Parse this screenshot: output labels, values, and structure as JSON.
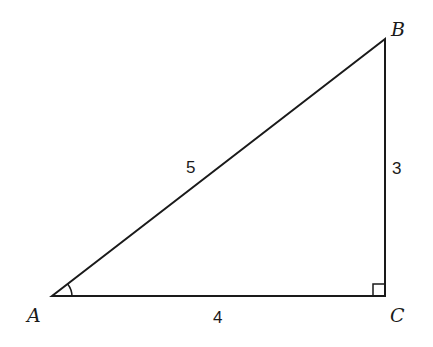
{
  "diagram": {
    "type": "right-triangle",
    "vertices": {
      "A": {
        "label": "A",
        "x": 52,
        "y": 296
      },
      "B": {
        "label": "B",
        "x": 385,
        "y": 39
      },
      "C": {
        "label": "C",
        "x": 385,
        "y": 296
      }
    },
    "sides": {
      "AB": {
        "label": "5"
      },
      "BC": {
        "label": "3"
      },
      "AC": {
        "label": "4"
      }
    },
    "marks": {
      "right_angle_at": "C",
      "angle_arc_at": "A"
    },
    "colors": {
      "stroke": "#1a1a1a",
      "background": "#ffffff"
    }
  }
}
